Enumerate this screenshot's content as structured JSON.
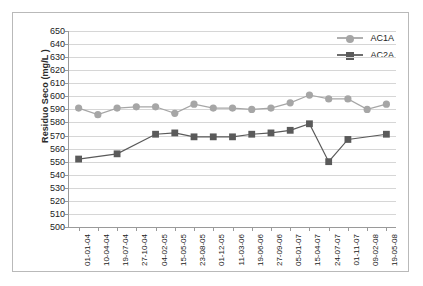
{
  "chart_data": {
    "type": "line",
    "title": "",
    "xlabel": "",
    "ylabel": "Residuo Seco (mg/L )",
    "ylim": [
      500,
      650
    ],
    "ytick_step": 10,
    "yticks": [
      650,
      640,
      630,
      620,
      610,
      600,
      590,
      580,
      570,
      560,
      550,
      540,
      530,
      520,
      510,
      500
    ],
    "grid": true,
    "legend_position": "top-right",
    "categories": [
      "01-01-04",
      "10-04-04",
      "19-07-04",
      "27-10-04",
      "04-02-05",
      "15-05-05",
      "23-08-05",
      "01-12-05",
      "11-03-06",
      "19-06-06",
      "27-09-06",
      "05-01-07",
      "15-04-07",
      "24-07-07",
      "01-11-07",
      "09-02-08",
      "19-05-08"
    ],
    "series": [
      {
        "name": "AC1A",
        "color": "#a6a6a6",
        "marker": "circle",
        "values": [
          591,
          586,
          591,
          592,
          592,
          587,
          594,
          591,
          591,
          590,
          591,
          595,
          601,
          598,
          598,
          590,
          594
        ]
      },
      {
        "name": "AC2A",
        "color": "#5a5a5a",
        "marker": "square",
        "values": [
          552,
          null,
          556,
          null,
          571,
          572,
          569,
          569,
          569,
          571,
          572,
          574,
          579,
          550,
          567,
          null,
          571
        ]
      }
    ]
  },
  "legend": {
    "items": [
      {
        "label": "AC1A"
      },
      {
        "label": "AC2A"
      }
    ]
  }
}
